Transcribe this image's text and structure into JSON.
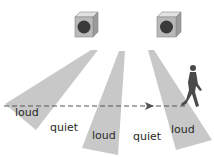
{
  "diagram": {
    "speakers": [
      {
        "id": "left-speaker"
      },
      {
        "id": "right-speaker"
      }
    ],
    "beams": [
      "beam-1",
      "beam-2",
      "beam-3"
    ],
    "labels": {
      "l1": "loud",
      "q1": "quiet",
      "l2": "loud",
      "q2": "quiet",
      "l3": "loud"
    },
    "colors": {
      "beam": "#c8c8c8",
      "speaker_face": "#b9b9b9",
      "speaker_top": "#e2e2e2",
      "speaker_side": "#9a9a9a",
      "cone": "#3a3a3a",
      "person": "#4a4a4a",
      "dash": "#555555"
    }
  }
}
